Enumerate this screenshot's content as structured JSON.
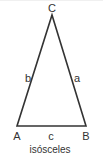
{
  "diagram": {
    "type": "triangle",
    "caption": "isósceles",
    "stroke_color": "#333333",
    "vertices": [
      {
        "name": "A",
        "x": 17,
        "y": 126
      },
      {
        "name": "B",
        "x": 86,
        "y": 126
      },
      {
        "name": "C",
        "x": 52,
        "y": 15
      }
    ],
    "vertex_labels": {
      "A": "A",
      "B": "B",
      "C": "C"
    },
    "side_labels": {
      "a": "a",
      "b": "b",
      "c": "c"
    }
  }
}
